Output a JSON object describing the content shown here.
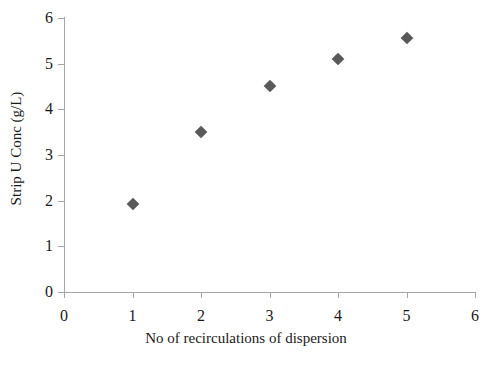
{
  "chart_data": {
    "type": "scatter",
    "title": "",
    "subtitle": "",
    "xlabel": "No of recirculations of dispersion",
    "ylabel": "Strip U Conc (g/L)",
    "xlim": [
      0,
      6
    ],
    "ylim": [
      0,
      6
    ],
    "xticks": [
      "0",
      "1",
      "2",
      "3",
      "4",
      "5",
      "6"
    ],
    "yticks": [
      "0",
      "1",
      "2",
      "3",
      "4",
      "5",
      "6"
    ],
    "xtick_values": [
      0,
      1,
      2,
      3,
      4,
      5,
      6
    ],
    "ytick_values": [
      0,
      1,
      2,
      3,
      4,
      5,
      6
    ],
    "grid": false,
    "legend": false,
    "legend_position": "none",
    "marker_shape": "diamond",
    "marker_color": "#595959",
    "axis_color": "#a6a6a6",
    "text_color": "#1a1a1a",
    "background_color": "#ffffff",
    "x": [
      1,
      2,
      3,
      4,
      5
    ],
    "values": [
      1.93,
      3.5,
      4.51,
      5.1,
      5.56
    ],
    "points": [
      {
        "x": 1,
        "y": 1.93
      },
      {
        "x": 2,
        "y": 3.5
      },
      {
        "x": 3,
        "y": 4.51
      },
      {
        "x": 4,
        "y": 5.1
      },
      {
        "x": 5,
        "y": 5.56
      }
    ],
    "annotations": []
  }
}
